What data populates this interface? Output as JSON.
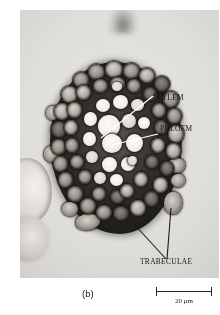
{
  "figure": {
    "caption": "(b)",
    "kind": "light-micrograph-root-cross-section"
  },
  "annotations": {
    "xylem": "XYLEM",
    "phloem": "PHLOEM",
    "trabeculae": "TRABECULAE"
  },
  "scale_bar": {
    "length_label": "20 μm"
  },
  "colors": {
    "background": "#ffffff",
    "plate": "#f2f1ef",
    "tissue_dark": "#262422",
    "lumen_bright": "#fbfaf8",
    "label_text": "#17150f",
    "leader_white": "#ffffff",
    "leader_black": "#1d1b19"
  }
}
